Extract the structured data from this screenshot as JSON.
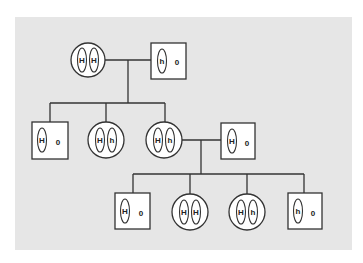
{
  "diagram": {
    "type": "pedigree",
    "colors": {
      "panel": "#e6e6e6",
      "line": "#333333",
      "shape_fill": "#ffffff"
    },
    "generations": [
      {
        "id": "I",
        "individuals": [
          {
            "id": "I-1",
            "sex": "female",
            "shape": "circle",
            "alleles": [
              "H",
              "H"
            ]
          },
          {
            "id": "I-2",
            "sex": "male",
            "shape": "square",
            "alleles": [
              "h"
            ],
            "y_marker": "0"
          }
        ]
      },
      {
        "id": "II",
        "individuals": [
          {
            "id": "II-1",
            "sex": "male",
            "shape": "square",
            "alleles": [
              "H"
            ],
            "y_marker": "0"
          },
          {
            "id": "II-2",
            "sex": "female",
            "shape": "circle",
            "alleles": [
              "H",
              "h"
            ]
          },
          {
            "id": "II-3",
            "sex": "female",
            "shape": "circle",
            "alleles": [
              "H",
              "h"
            ]
          },
          {
            "id": "II-4",
            "sex": "male",
            "shape": "square",
            "alleles": [
              "H"
            ],
            "y_marker": "0"
          }
        ]
      },
      {
        "id": "III",
        "individuals": [
          {
            "id": "III-1",
            "sex": "male",
            "shape": "square",
            "alleles": [
              "H"
            ],
            "y_marker": "0"
          },
          {
            "id": "III-2",
            "sex": "female",
            "shape": "circle",
            "alleles": [
              "H",
              "H"
            ]
          },
          {
            "id": "III-3",
            "sex": "female",
            "shape": "circle",
            "alleles": [
              "H",
              "h"
            ]
          },
          {
            "id": "III-4",
            "sex": "male",
            "shape": "square",
            "alleles": [
              "h"
            ],
            "y_marker": "0"
          }
        ]
      }
    ],
    "matings": [
      {
        "partners": [
          "I-1",
          "I-2"
        ],
        "children": [
          "II-1",
          "II-2",
          "II-3"
        ]
      },
      {
        "partners": [
          "II-3",
          "II-4"
        ],
        "children": [
          "III-1",
          "III-2",
          "III-3",
          "III-4"
        ]
      }
    ],
    "labels": {
      "I1_a": "H",
      "I1_b": "H",
      "I2_a": "h",
      "I2_y": "0",
      "II1_a": "H",
      "II1_y": "0",
      "II2_a": "H",
      "II2_b": "h",
      "II3_a": "H",
      "II3_b": "h",
      "II4_a": "H",
      "II4_y": "0",
      "III1_a": "H",
      "III1_y": "0",
      "III2_a": "H",
      "III2_b": "H",
      "III3_a": "H",
      "III3_b": "h",
      "III4_a": "h",
      "III4_y": "0"
    }
  }
}
